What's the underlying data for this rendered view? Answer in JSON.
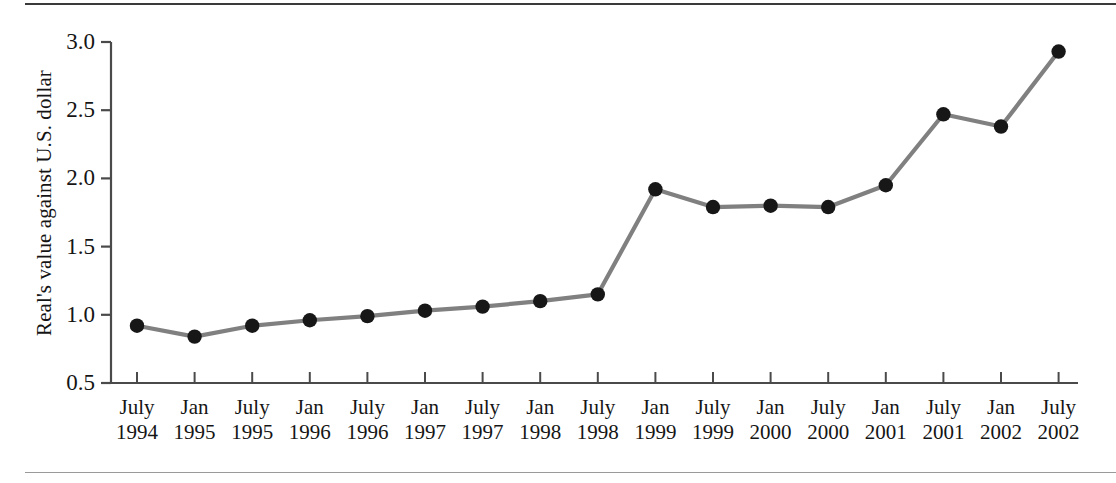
{
  "figure": {
    "y_axis_title": "Real's value against U.S. dollar",
    "line_color": "#808080",
    "marker_color": "#171717",
    "axis_color": "#4a4a4a",
    "background": "#ffffff"
  },
  "chart_data": {
    "type": "line",
    "title": "",
    "xlabel": "",
    "ylabel": "Real's value against U.S. dollar",
    "ylim": [
      0.5,
      3.0
    ],
    "yticks": [
      "0.5",
      "1.0",
      "1.5",
      "2.0",
      "2.5",
      "3.0"
    ],
    "ytick_values": [
      0.5,
      1.0,
      1.5,
      2.0,
      2.5,
      3.0
    ],
    "grid": false,
    "legend": "none",
    "categories": [
      "July 1994",
      "Jan 1995",
      "July 1995",
      "Jan 1996",
      "July 1996",
      "Jan 1997",
      "July 1997",
      "Jan 1998",
      "July 1998",
      "Jan 1999",
      "July 1999",
      "Jan 2000",
      "July 2000",
      "Jan 2001",
      "July 2001",
      "Jan 2002",
      "July 2002"
    ],
    "xtick_labels": [
      {
        "month": "July",
        "year": "1994"
      },
      {
        "month": "Jan",
        "year": "1995"
      },
      {
        "month": "July",
        "year": "1995"
      },
      {
        "month": "Jan",
        "year": "1996"
      },
      {
        "month": "July",
        "year": "1996"
      },
      {
        "month": "Jan",
        "year": "1997"
      },
      {
        "month": "July",
        "year": "1997"
      },
      {
        "month": "Jan",
        "year": "1998"
      },
      {
        "month": "July",
        "year": "1998"
      },
      {
        "month": "Jan",
        "year": "1999"
      },
      {
        "month": "July",
        "year": "1999"
      },
      {
        "month": "Jan",
        "year": "2000"
      },
      {
        "month": "July",
        "year": "2000"
      },
      {
        "month": "Jan",
        "year": "2001"
      },
      {
        "month": "July",
        "year": "2001"
      },
      {
        "month": "Jan",
        "year": "2002"
      },
      {
        "month": "July",
        "year": "2002"
      }
    ],
    "values": [
      0.92,
      0.84,
      0.92,
      0.96,
      0.99,
      1.03,
      1.06,
      1.1,
      1.15,
      1.92,
      1.79,
      1.8,
      1.79,
      1.95,
      2.47,
      2.38,
      2.93
    ]
  }
}
